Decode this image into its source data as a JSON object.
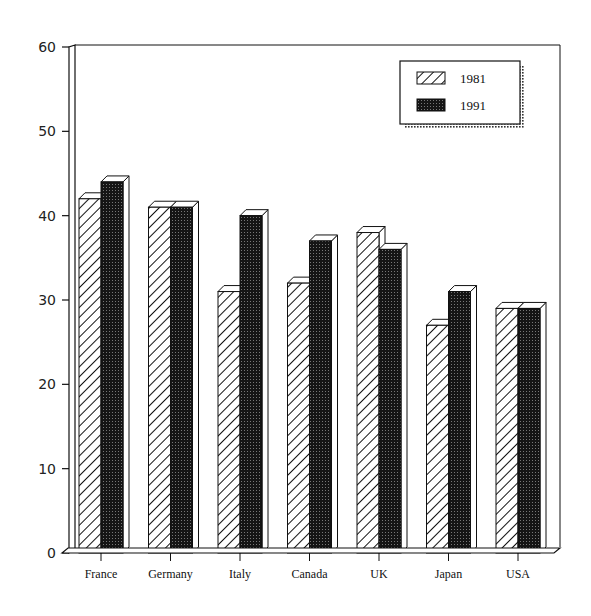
{
  "chart_data": {
    "type": "bar",
    "style": "3d-grouped",
    "title": "",
    "xlabel": "",
    "ylabel": "",
    "ylim": [
      0,
      60
    ],
    "yticks": [
      0,
      10,
      20,
      30,
      40,
      50,
      60
    ],
    "grid": false,
    "legend_position": "top-right",
    "categories": [
      "France",
      "Germany",
      "Italy",
      "Canada",
      "UK",
      "Japan",
      "USA"
    ],
    "series": [
      {
        "name": "1981",
        "pattern": "diagonal-hatch",
        "values": [
          42,
          41,
          31,
          32,
          38,
          27,
          29
        ]
      },
      {
        "name": "1991",
        "pattern": "dark-stipple",
        "values": [
          44,
          41,
          40,
          37,
          36,
          31,
          29
        ]
      }
    ]
  },
  "legend": {
    "items": [
      {
        "label": "1981",
        "pattern": "diagonal-hatch"
      },
      {
        "label": "1991",
        "pattern": "dark-stipple"
      }
    ]
  },
  "colors": {
    "ink": "#111111",
    "fill_dark": "#1a1a1a",
    "background": "#ffffff"
  }
}
